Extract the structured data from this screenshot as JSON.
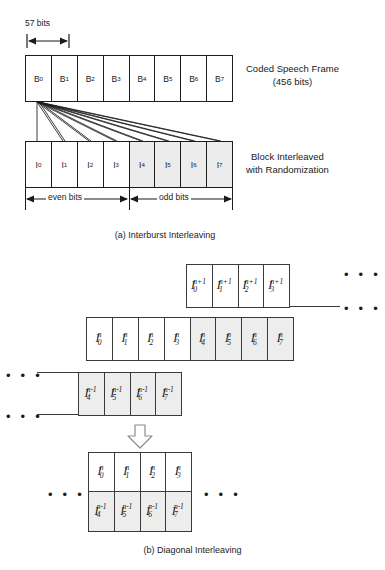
{
  "figure": {
    "panel_a": {
      "dimension_label": "57 bits",
      "top_row": {
        "cells": [
          {
            "base": "B",
            "sub": "0"
          },
          {
            "base": "B",
            "sub": "1"
          },
          {
            "base": "B",
            "sub": "2"
          },
          {
            "base": "B",
            "sub": "3"
          },
          {
            "base": "B",
            "sub": "4"
          },
          {
            "base": "B",
            "sub": "5"
          },
          {
            "base": "B",
            "sub": "6"
          },
          {
            "base": "B",
            "sub": "7"
          }
        ],
        "note_line1": "Coded Speech Frame",
        "note_line2": "(456 bits)"
      },
      "bottom_row": {
        "cells": [
          {
            "base": "I",
            "sub": "0",
            "shaded": false
          },
          {
            "base": "I",
            "sub": "1",
            "shaded": false
          },
          {
            "base": "I",
            "sub": "2",
            "shaded": false
          },
          {
            "base": "I",
            "sub": "3",
            "shaded": false
          },
          {
            "base": "I",
            "sub": "4",
            "shaded": true
          },
          {
            "base": "I",
            "sub": "5",
            "shaded": true
          },
          {
            "base": "I",
            "sub": "6",
            "shaded": true
          },
          {
            "base": "I",
            "sub": "7",
            "shaded": true
          }
        ],
        "note_line1": "Block Interleaved",
        "note_line2": "with Randomization"
      },
      "span_left_label": "even bits",
      "span_right_label": "odd bits",
      "caption": "(a) Interburst Interleaving"
    },
    "panel_b": {
      "row_next": {
        "cells": [
          {
            "base": "I",
            "sub": "0",
            "sup": "n+1"
          },
          {
            "base": "I",
            "sub": "1",
            "sup": "n+1"
          },
          {
            "base": "I",
            "sub": "2",
            "sup": "n+1"
          },
          {
            "base": "I",
            "sub": "3",
            "sup": "n+1"
          }
        ]
      },
      "row_current": {
        "cells": [
          {
            "base": "I",
            "sub": "0",
            "sup": "n",
            "shaded": false
          },
          {
            "base": "I",
            "sub": "1",
            "sup": "n",
            "shaded": false
          },
          {
            "base": "I",
            "sub": "2",
            "sup": "n",
            "shaded": false
          },
          {
            "base": "I",
            "sub": "3",
            "sup": "n",
            "shaded": false
          },
          {
            "base": "I",
            "sub": "4",
            "sup": "n",
            "shaded": true
          },
          {
            "base": "I",
            "sub": "5",
            "sup": "n",
            "shaded": true
          },
          {
            "base": "I",
            "sub": "6",
            "sup": "n",
            "shaded": true
          },
          {
            "base": "I",
            "sub": "7",
            "sup": "n",
            "shaded": true
          }
        ]
      },
      "row_prev": {
        "cells": [
          {
            "base": "I",
            "sub": "4",
            "sup": "n-1"
          },
          {
            "base": "I",
            "sub": "5",
            "sup": "n-1"
          },
          {
            "base": "I",
            "sub": "6",
            "sup": "n-1"
          },
          {
            "base": "I",
            "sub": "7",
            "sup": "n-1"
          }
        ]
      },
      "result_grid": {
        "top": [
          {
            "base": "I",
            "sub": "0",
            "sup": "n"
          },
          {
            "base": "I",
            "sub": "1",
            "sup": "n"
          },
          {
            "base": "I",
            "sub": "2",
            "sup": "n"
          },
          {
            "base": "I",
            "sub": "3",
            "sup": "n"
          }
        ],
        "bottom": [
          {
            "base": "I",
            "sub": "4",
            "sup": "n-1"
          },
          {
            "base": "I",
            "sub": "5",
            "sup": "n-1"
          },
          {
            "base": "I",
            "sub": "6",
            "sup": "n-1"
          },
          {
            "base": "I",
            "sub": "7",
            "sup": "n-1"
          }
        ]
      },
      "ellipsis": "• • •",
      "caption": "(b) Diagonal Interleaving"
    },
    "colors": {
      "stroke": "#1b1b1b",
      "stroke_soft": "#3a3a3a",
      "cell_shade": "#ececec",
      "background": "#ffffff"
    }
  }
}
